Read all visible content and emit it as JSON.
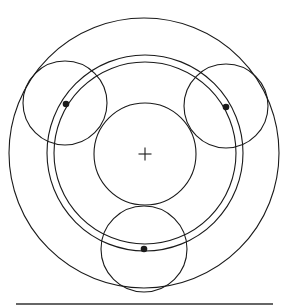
{
  "diagram": {
    "title": "",
    "stroke_color": "#1a1a1a",
    "background": "#ffffff",
    "outer_ring": {
      "cx": 144,
      "cy": 153,
      "r": 135
    },
    "carrier_ring": {
      "cx": 145,
      "cy": 153,
      "r_outer": 98,
      "r_inner": 91
    },
    "sun_gear": {
      "cx": 145,
      "cy": 154,
      "r": 51
    },
    "planets": [
      {
        "name": "upper-left",
        "cx": 65,
        "cy": 103,
        "r": 42,
        "pin": {
          "x": 66,
          "y": 104
        }
      },
      {
        "name": "upper-right",
        "cx": 226,
        "cy": 106,
        "r": 42,
        "pin": {
          "x": 226,
          "y": 107
        }
      },
      {
        "name": "bottom",
        "cx": 144,
        "cy": 249,
        "r": 43,
        "pin": {
          "x": 144,
          "y": 249
        }
      }
    ],
    "center_mark": {
      "x": 145,
      "y": 154,
      "size": 11
    },
    "baseline": {
      "x1": 16,
      "x2": 273,
      "y": 304
    }
  }
}
